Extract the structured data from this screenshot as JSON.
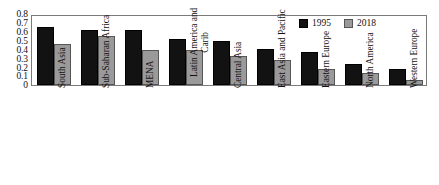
{
  "chart_data": {
    "type": "bar",
    "title": "",
    "subtitle": "",
    "xlabel": "",
    "ylabel": "",
    "ylim": [
      0,
      0.8
    ],
    "ytick_values": [
      0.8,
      0.7,
      0.6,
      0.5,
      0.4,
      0.3,
      0.2,
      0.1,
      0
    ],
    "ytick_labels": [
      "0.8",
      "0.7",
      "0.6",
      "0.5",
      "0.4",
      "0.3",
      "0.2",
      "0.1",
      "0"
    ],
    "grid": false,
    "legend_position": "top-right",
    "categories": [
      "South Asia",
      "Sub-Saharan Africa",
      "MENA",
      "Latin America and Carib",
      "Central Asia",
      "East Asia and Pacific",
      "Eastern Europe",
      "North America",
      "Western Europe"
    ],
    "category_lines": [
      [
        "South Asia"
      ],
      [
        "Sub-Saharan Africa"
      ],
      [
        "MENA"
      ],
      [
        "Latin America and",
        "Carib"
      ],
      [
        "Central Asia"
      ],
      [
        "East Asia and Pacific"
      ],
      [
        "Eastern Europe"
      ],
      [
        "North America"
      ],
      [
        "Western Europe"
      ]
    ],
    "series": [
      {
        "name": "1995",
        "color": "#121212",
        "values": [
          0.655,
          0.625,
          0.625,
          0.515,
          0.5,
          0.405,
          0.375,
          0.24,
          0.18
        ]
      },
      {
        "name": "2018",
        "color": "#9a9a9a",
        "values": [
          0.465,
          0.555,
          0.395,
          0.39,
          0.33,
          0.28,
          0.175,
          0.135,
          0.055
        ]
      }
    ]
  },
  "legend": {
    "entries": [
      {
        "label": "1995",
        "color": "#121212"
      },
      {
        "label": "2018",
        "color": "#9a9a9a"
      }
    ]
  }
}
